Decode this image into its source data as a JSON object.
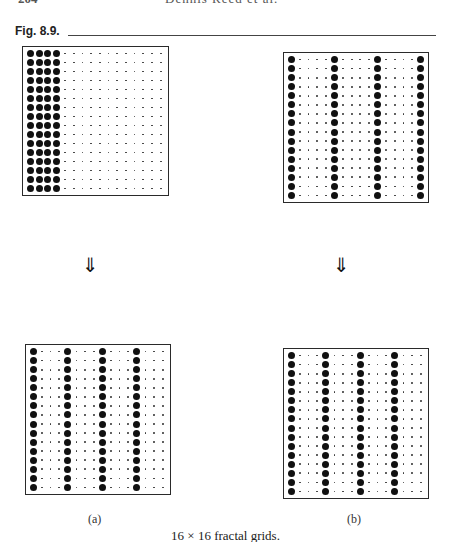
{
  "running_head": {
    "page_number": "204",
    "author": "Dennis Reed et al."
  },
  "figure": {
    "label": "Fig. 8.9.",
    "caption": "16 × 16 fractal grids.",
    "arrow_glyph": "⇓",
    "panels": [
      {
        "id": "a-before",
        "rows": 16,
        "cols": 16,
        "big_columns": [
          0,
          1,
          2,
          3
        ],
        "box": {
          "left": 22,
          "top": 46,
          "width": 147,
          "height": 150
        }
      },
      {
        "id": "b-before",
        "rows": 16,
        "cols": 16,
        "big_columns": [
          0,
          5,
          10,
          15
        ],
        "box": {
          "left": 283,
          "top": 52,
          "width": 146,
          "height": 151
        }
      },
      {
        "id": "a-after",
        "rows": 16,
        "cols": 16,
        "big_columns": [
          0,
          4,
          8,
          12
        ],
        "box": {
          "left": 25,
          "top": 344,
          "width": 146,
          "height": 151
        }
      },
      {
        "id": "b-after",
        "rows": 16,
        "cols": 16,
        "big_columns": [
          0,
          4,
          8,
          12
        ],
        "box": {
          "left": 283,
          "top": 348,
          "width": 146,
          "height": 151
        }
      }
    ],
    "sub_labels": {
      "a": "(a)",
      "b": "(b)"
    }
  }
}
